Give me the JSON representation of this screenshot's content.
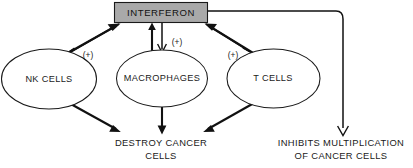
{
  "diagram": {
    "title_box": {
      "label": "INTERFERON",
      "fill_color": "#a9a9a9",
      "stroke_color": "#1a1a1a"
    },
    "nodes": [
      {
        "id": "nk-cells",
        "label": "NK CELLS"
      },
      {
        "id": "macrophages",
        "label": "MACROPHAGES"
      },
      {
        "id": "t-cells",
        "label": "T CELLS"
      }
    ],
    "edge_labels": {
      "nk_plus": "(+)",
      "macrophage_plus": "(+)",
      "tcell_plus": "(+)"
    },
    "outcomes": [
      {
        "id": "destroy-cancer-cells",
        "line1": "DESTROY CANCER",
        "line2": "CELLS"
      },
      {
        "id": "inhibits-multiplication",
        "line1": "INHIBITS MULTIPLICATION",
        "line2": "OF CANCER CELLS"
      }
    ]
  }
}
